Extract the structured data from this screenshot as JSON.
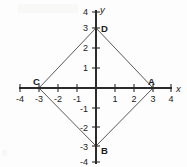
{
  "figure": {
    "type": "coordinate-plane-rhombus",
    "axis_labels": {
      "x": "x",
      "y": "y"
    },
    "origin_px": {
      "x": 96,
      "y": 88
    },
    "unit_px": {
      "x": 19,
      "y": 20
    },
    "x_ticks": [
      {
        "value": -4,
        "label": "-4"
      },
      {
        "value": -3,
        "label": "-3"
      },
      {
        "value": -2,
        "label": "-2"
      },
      {
        "value": -1,
        "label": "-1"
      },
      {
        "value": 1,
        "label": "1"
      },
      {
        "value": 2,
        "label": "2"
      },
      {
        "value": 3,
        "label": "3"
      },
      {
        "value": 4,
        "label": "4"
      }
    ],
    "y_ticks": [
      {
        "value": 4,
        "label": "4"
      },
      {
        "value": 3,
        "label": "3"
      },
      {
        "value": 2,
        "label": "2"
      },
      {
        "value": 1,
        "label": "1"
      },
      {
        "value": -1,
        "label": "-1"
      },
      {
        "value": -2,
        "label": "-2"
      },
      {
        "value": -3,
        "label": "-3"
      },
      {
        "value": -4,
        "label": "-4"
      }
    ],
    "xlim": [
      -4,
      4
    ],
    "ylim": [
      -4,
      4
    ],
    "grid": false,
    "points": [
      {
        "name": "A",
        "label": "A",
        "x": 3,
        "y": 0
      },
      {
        "name": "B",
        "label": "B",
        "x": 0,
        "y": -3
      },
      {
        "name": "C",
        "label": "C",
        "x": -3,
        "y": 0
      },
      {
        "name": "D",
        "label": "D",
        "x": 0,
        "y": 3
      }
    ],
    "edges": [
      [
        "D",
        "A"
      ],
      [
        "A",
        "B"
      ],
      [
        "B",
        "C"
      ],
      [
        "C",
        "D"
      ]
    ],
    "colors": {
      "axis": "#2b2b2b",
      "shape": "#3a3a3a",
      "text": "#1a1a1a",
      "background": "#fdfdfd"
    }
  }
}
